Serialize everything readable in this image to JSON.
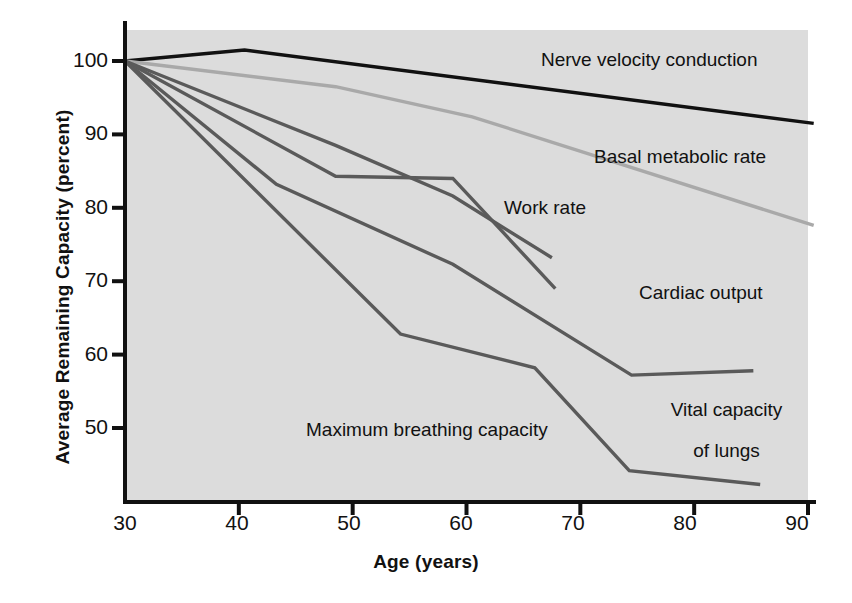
{
  "chart_data": {
    "type": "line",
    "title": "",
    "subtitle": "",
    "xlabel": "Age (years)",
    "ylabel": "Average Remaining Capacity (percent)",
    "xlim": [
      30,
      90
    ],
    "ylim": [
      42,
      104
    ],
    "xticks": [
      30,
      40,
      50,
      60,
      70,
      80,
      90
    ],
    "yticks": [
      50,
      60,
      70,
      80,
      90,
      100
    ],
    "grid": false,
    "legend_position": "inline-annotations",
    "plot_background": "#dcdcdc",
    "series": [
      {
        "name": "Nerve velocity conduction",
        "color": "#111111",
        "width": 3.4,
        "x": [
          30,
          40.5,
          90.5
        ],
        "y": [
          100,
          101.5,
          91.5
        ],
        "label_x": 61.5,
        "label_y": 101.0
      },
      {
        "name": "Basal metabolic rate",
        "color": "#a9a9a9",
        "width": 3.4,
        "x": [
          30,
          48.5,
          60.5,
          90.5
        ],
        "y": [
          100,
          96.5,
          92.4,
          77.6
        ],
        "label_x": 68.0,
        "label_y": 86.0
      },
      {
        "name": "Work rate",
        "color": "#5a5a5a",
        "width": 3.4,
        "x": [
          30,
          48.5,
          58.8,
          67.5
        ],
        "y": [
          100,
          88.5,
          81.6,
          73.2
        ],
        "label_x": 56.5,
        "label_y": 79.5
      },
      {
        "name": "Cardiac output",
        "color": "#5a5a5a",
        "width": 3.4,
        "x": [
          30,
          48.5,
          58.8,
          67.8
        ],
        "y": [
          100,
          84.3,
          84.0,
          69.0
        ],
        "label_x": 68.5,
        "label_y": 69.5
      },
      {
        "name": "Vital capacity of lungs",
        "color": "#5a5a5a",
        "width": 3.4,
        "x": [
          30,
          43.3,
          58.8,
          74.5,
          85.2
        ],
        "y": [
          100,
          83.2,
          72.3,
          57.2,
          57.8
        ],
        "label_x": 79.0,
        "label_y": 54.0
      },
      {
        "name": "Maximum breathing capacity",
        "color": "#5a5a5a",
        "width": 3.4,
        "x": [
          30,
          54.2,
          66.0,
          74.3,
          85.8
        ],
        "y": [
          100,
          62.8,
          58.2,
          44.2,
          42.3
        ],
        "label_x": 51.5,
        "label_y": 47.8
      }
    ],
    "annotations": [
      {
        "id": "nerve",
        "text": "Nerve velocity conduction",
        "align": "left"
      },
      {
        "id": "basal",
        "text": "Basal metabolic rate",
        "align": "left"
      },
      {
        "id": "work",
        "text": "Work rate",
        "align": "left"
      },
      {
        "id": "cardiac",
        "text": "Cardiac output",
        "align": "left"
      },
      {
        "id": "vital",
        "text": "Vital capacity\nof lungs",
        "align": "center"
      },
      {
        "id": "breathing",
        "text": "Maximum breathing capacity",
        "align": "left"
      }
    ]
  },
  "axes": {
    "y_title": "Average Remaining Capacity (percent)",
    "x_title": "Age (years)",
    "y_tick_labels": [
      "100",
      "90",
      "80",
      "70",
      "60",
      "50"
    ],
    "x_tick_labels": [
      "30",
      "40",
      "50",
      "60",
      "70",
      "80",
      "90"
    ]
  },
  "labels": {
    "nerve_velocity_conduction": "Nerve velocity conduction",
    "basal_metabolic_rate": "Basal metabolic rate",
    "work_rate": "Work rate",
    "cardiac_output": "Cardiac output",
    "vital_capacity_line1": "Vital capacity",
    "vital_capacity_line2": "of lungs",
    "maximum_breathing_capacity": "Maximum breathing capacity"
  },
  "colors": {
    "axis": "#111111",
    "plot_bg": "#dcdcdc",
    "page_bg": "#ffffff",
    "dark_series": "#5a5a5a",
    "black_series": "#111111",
    "light_series": "#a9a9a9"
  }
}
